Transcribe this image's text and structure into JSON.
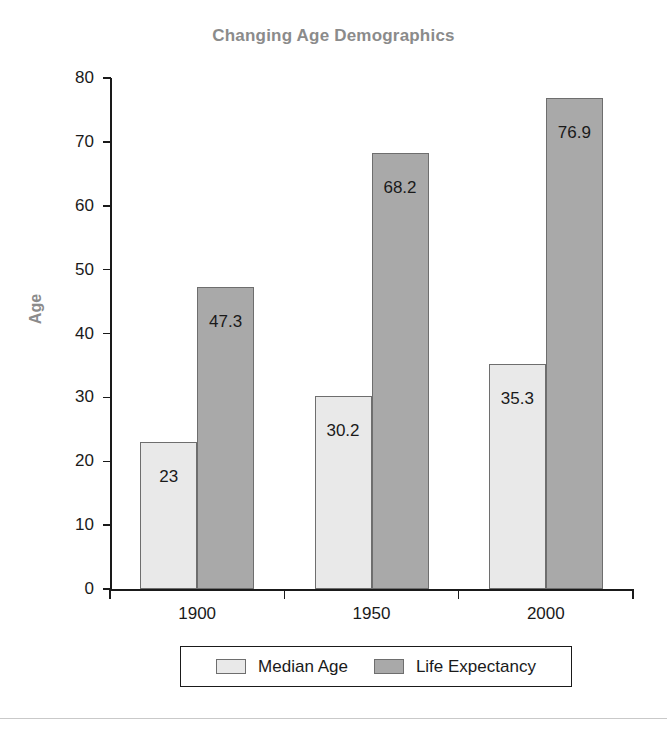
{
  "chart_data": {
    "type": "bar",
    "title": "Changing Age Demographics",
    "xlabel": "",
    "ylabel": "Age",
    "categories": [
      "1900",
      "1950",
      "2000"
    ],
    "series": [
      {
        "name": "Median Age",
        "color": "#e9e9e9",
        "values": [
          23,
          30.2,
          35.3
        ],
        "labels": [
          "23",
          "30.2",
          "35.3"
        ]
      },
      {
        "name": "Life Expectancy",
        "color": "#a9a9a9",
        "values": [
          47.3,
          68.2,
          76.9
        ],
        "labels": [
          "47.3",
          "68.2",
          "76.9"
        ]
      }
    ],
    "ylim": [
      0,
      80
    ],
    "yticks": [
      0,
      10,
      20,
      30,
      40,
      50,
      60,
      70,
      80
    ],
    "ytick_labels": [
      "0",
      "10",
      "20",
      "30",
      "40",
      "50",
      "60",
      "70",
      "80"
    ],
    "grid": false,
    "legend_position": "bottom",
    "value_labels_inside_bars": true
  },
  "styles": {
    "title_color": "#8b8b8b",
    "axis_color": "#1a1a1a",
    "text_color": "#1a1a1a",
    "background": "#ffffff"
  }
}
